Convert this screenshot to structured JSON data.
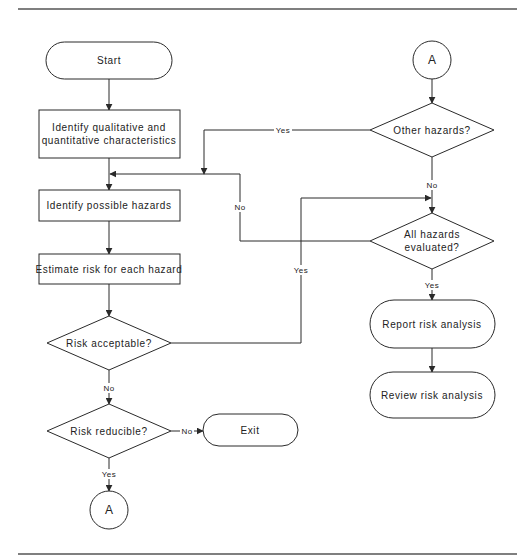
{
  "diagram": {
    "type": "flowchart",
    "nodes": {
      "start": "Start",
      "identify_characteristics_line1": "Identify qualitative and",
      "identify_characteristics_line2": "quantitative characteristics",
      "identify_hazards": "Identify possible hazards",
      "estimate_risk": "Estimate risk for each hazard",
      "risk_acceptable": "Risk acceptable?",
      "risk_reducible": "Risk reducible?",
      "exit": "Exit",
      "connector_bottom": "A",
      "connector_top": "A",
      "other_hazards": "Other hazards?",
      "all_evaluated_line1": "All hazards",
      "all_evaluated_line2": "evaluated?",
      "report": "Report risk analysis",
      "review": "Review risk analysis"
    },
    "edges": {
      "other_hazards_yes": "Yes",
      "other_hazards_no": "No",
      "all_evaluated_no": "No",
      "all_evaluated_yes": "Yes",
      "risk_acceptable_yes": "Yes",
      "risk_acceptable_no": "No",
      "risk_reducible_no": "No",
      "risk_reducible_yes": "Yes"
    }
  }
}
